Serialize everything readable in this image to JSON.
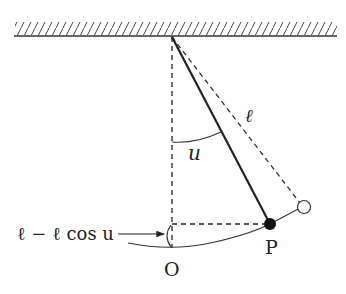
{
  "diagram": {
    "labels": {
      "length": "ℓ",
      "angle": "u",
      "height_expr": "ℓ − ℓ cos u",
      "origin": "O",
      "bob": "P"
    },
    "elements": {
      "ceiling": "hatched support",
      "pivot": "suspension point",
      "rod": "solid line from pivot to bob P",
      "extended_rod": "dashed line from pivot to hollow circle at max displacement",
      "vertical": "dashed vertical line from pivot to O",
      "horizontal": "dashed horizontal line from vertical to P",
      "arc": "circular path of bob through O and P",
      "angle_arc": "arc marking angle u between vertical and rod",
      "height_bracket": "small bracket at O indicating height ℓ − ℓ cos u"
    },
    "colors": {
      "stroke": "#222222",
      "background": "#ffffff"
    }
  }
}
